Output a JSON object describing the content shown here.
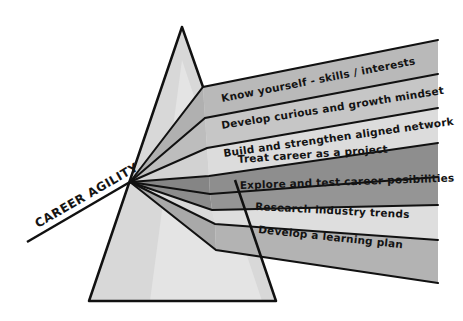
{
  "title": "CAREER AGILITY",
  "colors": {
    "background": "#ffffff",
    "outline": "#111111",
    "prism_fill": "#d6d6d6",
    "prism_highlight": "#e6e6e6"
  },
  "bands": [
    {
      "label": "Know yourself - skills / interests",
      "color": "#b9b9b9"
    },
    {
      "label": "Develop curious and growth mindset",
      "color": "#c6c6c6"
    },
    {
      "label": "Build and strengthen aligned network",
      "color": "#dcdcdc"
    },
    {
      "label": "Treat career as a project",
      "color": "#8e8e8e"
    },
    {
      "label": "Explore and test career posibilities",
      "color": "#959595"
    },
    {
      "label": "Research industry trends",
      "color": "#dedede"
    },
    {
      "label": "Develop a learning plan",
      "color": "#b3b3b3"
    }
  ]
}
